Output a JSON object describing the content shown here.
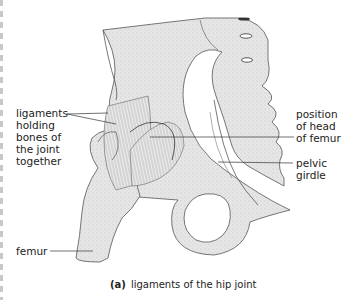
{
  "figure": {
    "title": "ligaments of the hip joint",
    "panel_letter": "(a)",
    "colors": {
      "bone_fill": "#e4e4e4",
      "bone_shade": "#c9c9c9",
      "outline": "#555555",
      "ligament_lines": "#777777",
      "leader_lines": "#333333",
      "text": "#222222"
    }
  },
  "labels": [
    {
      "id": "ligaments",
      "lines": [
        "ligaments",
        "holding",
        "bones of",
        "the joint",
        "together"
      ]
    },
    {
      "id": "position_head_femur",
      "lines": [
        "position",
        "of head",
        "of femur"
      ]
    },
    {
      "id": "pelvic_girdle",
      "lines": [
        "pelvic",
        "girdle"
      ]
    },
    {
      "id": "femur",
      "lines": [
        "femur"
      ]
    }
  ]
}
